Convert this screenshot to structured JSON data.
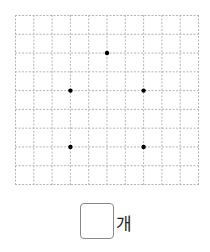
{
  "grid": {
    "cols": 10,
    "rows": 9,
    "line_color": "#b5b5b5",
    "dot_color": "#000000",
    "points": [
      {
        "col": 5,
        "row": 2
      },
      {
        "col": 3,
        "row": 4
      },
      {
        "col": 7,
        "row": 4
      },
      {
        "col": 3,
        "row": 7
      },
      {
        "col": 7,
        "row": 7
      }
    ]
  },
  "answer": {
    "value": "",
    "unit": "개"
  }
}
